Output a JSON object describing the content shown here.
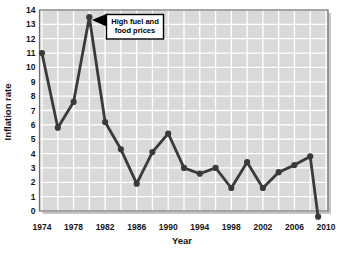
{
  "chart_data": {
    "type": "line",
    "title": "",
    "xlabel": "Year",
    "ylabel": "Inflation rate",
    "x": [
      1974,
      1976,
      1978,
      1980,
      1982,
      1984,
      1986,
      1988,
      1990,
      1992,
      1994,
      1996,
      1998,
      2000,
      2002,
      2004,
      2006,
      2008,
      2009
    ],
    "values": [
      11.0,
      5.8,
      7.6,
      13.5,
      6.2,
      4.3,
      1.9,
      4.1,
      5.4,
      3.0,
      2.6,
      3.0,
      1.6,
      3.4,
      1.6,
      2.7,
      3.2,
      3.8,
      -0.4
    ],
    "xticks": [
      1974,
      1978,
      1982,
      1986,
      1990,
      1994,
      1998,
      2002,
      2006,
      2010
    ],
    "yticks": [
      0,
      1,
      2,
      3,
      4,
      5,
      6,
      7,
      8,
      9,
      10,
      11,
      12,
      13,
      14
    ],
    "xlim": [
      1974,
      2010
    ],
    "ylim": [
      0,
      14
    ],
    "grid": true,
    "gridline_step_x_years": 2,
    "gridline_step_y_units": 1,
    "legend": "none",
    "annotation": {
      "line1": "High fuel and",
      "line2": "food prices",
      "target_year": 1980,
      "target_value": 13.5
    },
    "colors": {
      "line": "#3a3a3a",
      "marker": "#3a3a3a",
      "plot_background": "#d9d9d9",
      "gridline": "#ffffff",
      "plot_border": "#6e6e6e",
      "plot_shadow": "#c6c6c6",
      "ylabel_text": "#8b2121",
      "tick_text": "#141414",
      "annotation_background": "#ffffff",
      "annotation_border": "#000000",
      "page_background": "#ffffff"
    }
  }
}
